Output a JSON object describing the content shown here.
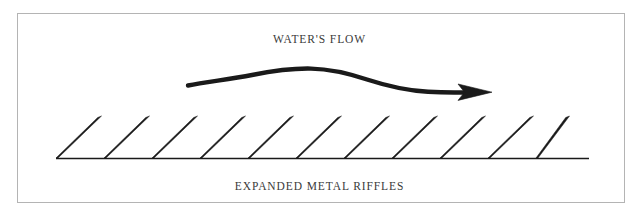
{
  "figure": {
    "background_color": "#ffffff",
    "frame": {
      "color": "#b4b4b4",
      "x": 17,
      "y": 13,
      "width": 608,
      "height": 190
    },
    "ink_color": "#1a1a1a",
    "label_color": "#3a3a3a"
  },
  "labels": {
    "flow": "WATER'S FLOW",
    "riffles": "EXPANDED METAL RIFFLES"
  },
  "chart_data": {
    "type": "diagram",
    "annotations": [
      {
        "name": "flow-label",
        "text": "WATER'S FLOW",
        "x": 320,
        "y": 43
      },
      {
        "name": "riffles-label",
        "text": "EXPANDED METAL RIFFLES",
        "x": 320,
        "y": 190
      }
    ],
    "flow_arrow": {
      "name": "waters-flow-arrow",
      "direction": "left-to-right",
      "start": [
        188,
        85
      ],
      "peak": [
        310,
        69
      ],
      "end": [
        470,
        92
      ],
      "tip": [
        492,
        92
      ],
      "stroke_width": 4.4
    },
    "baseline": {
      "name": "riffle-baseline",
      "x_start": 56,
      "x_end": 589,
      "y": 158,
      "stroke_width": 1.6
    },
    "riffle_blades": {
      "count": 11,
      "lean_direction": "right",
      "base_y": 158,
      "tip_y": 116,
      "spacing": 48,
      "bases_x": [
        57,
        105,
        153,
        201,
        249,
        297,
        345,
        393,
        441,
        489,
        537
      ],
      "tips_x": [
        99,
        147,
        195,
        243,
        291,
        339,
        387,
        435,
        483,
        531,
        567
      ],
      "width_base": 2.0,
      "width_tip": 5.0
    }
  }
}
